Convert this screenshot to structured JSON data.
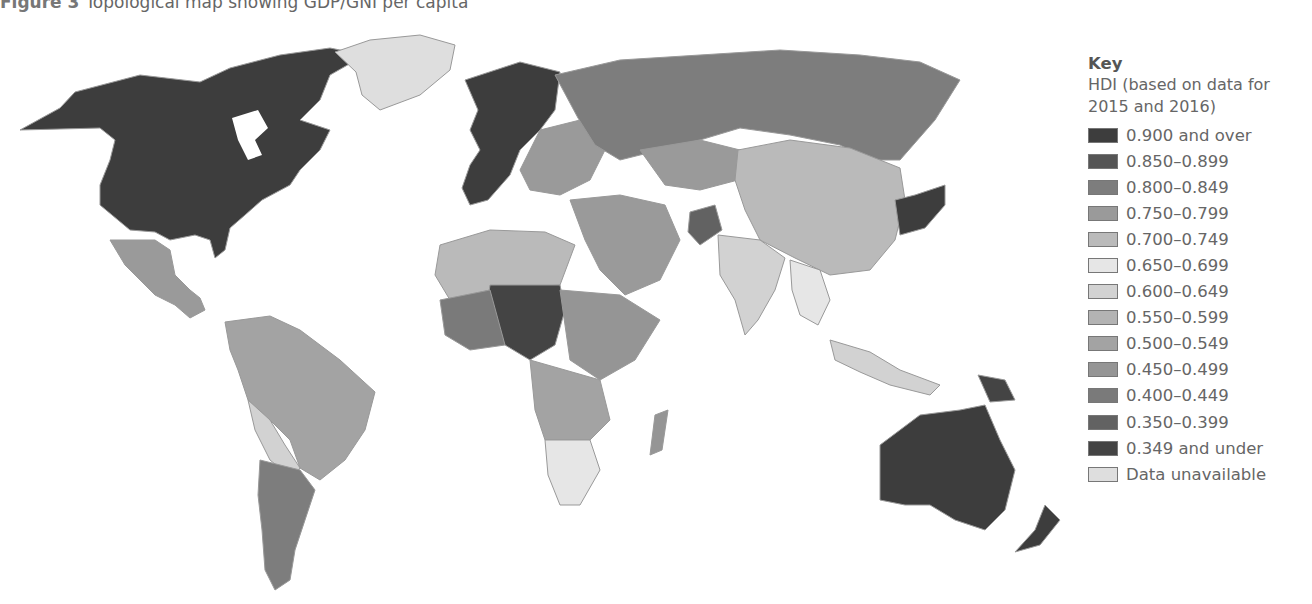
{
  "caption": {
    "label": "Figure 3",
    "text": "Topological map showing GDP/GNI per capita"
  },
  "legend": {
    "title": "Key",
    "subtitle_line1": "HDI (based on data for",
    "subtitle_line2": "2015 and 2016)",
    "items": [
      {
        "label": "0.900 and over",
        "color": "#3d3d3d"
      },
      {
        "label": "0.850–0.899",
        "color": "#555555"
      },
      {
        "label": "0.800–0.849",
        "color": "#7d7d7d"
      },
      {
        "label": "0.750–0.799",
        "color": "#9a9a9a"
      },
      {
        "label": "0.700–0.749",
        "color": "#bababa"
      },
      {
        "label": "0.650–0.699",
        "color": "#e6e6e6"
      },
      {
        "label": "0.600–0.649",
        "color": "#d2d2d2"
      },
      {
        "label": "0.550–0.599",
        "color": "#b3b3b3"
      },
      {
        "label": "0.500–0.549",
        "color": "#a3a3a3"
      },
      {
        "label": "0.450–0.499",
        "color": "#959595"
      },
      {
        "label": "0.400–0.449",
        "color": "#7a7a7a"
      },
      {
        "label": "0.350–0.399",
        "color": "#626262"
      },
      {
        "label": "0.349 and under",
        "color": "#444444"
      },
      {
        "label": "Data unavailable",
        "color": "#dedede"
      }
    ]
  },
  "map": {
    "title": "World map of Human Development Index",
    "ocean_color": "#ffffff",
    "regions": [
      {
        "name": "Canada/USA",
        "band": "0.900 and over"
      },
      {
        "name": "Greenland",
        "band": "Data unavailable"
      },
      {
        "name": "Mexico",
        "band": "0.750–0.799"
      },
      {
        "name": "South America",
        "band": "0.750–0.799"
      },
      {
        "name": "Argentina/Chile",
        "band": "0.800–0.849"
      },
      {
        "name": "Europe",
        "band": "0.900 and over"
      },
      {
        "name": "Russia",
        "band": "0.800–0.849"
      },
      {
        "name": "China/Central Asia",
        "band": "0.700–0.749"
      },
      {
        "name": "India/South Asia",
        "band": "0.600–0.649"
      },
      {
        "name": "North Africa",
        "band": "0.700–0.749"
      },
      {
        "name": "Sahel/Central Africa",
        "band": "0.349 and under"
      },
      {
        "name": "Southern Africa",
        "band": "0.650–0.699"
      },
      {
        "name": "Japan/Korea",
        "band": "0.900 and over"
      },
      {
        "name": "Australia/New Zealand",
        "band": "0.900 and over"
      },
      {
        "name": "Southeast Asia",
        "band": "0.650–0.699"
      }
    ]
  }
}
